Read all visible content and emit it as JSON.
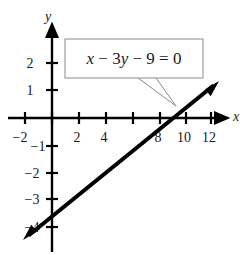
{
  "figure": {
    "background_color": "#ffffff",
    "ink_color": "#000000",
    "callout_border_color": "#888888"
  },
  "callout": {
    "equation": "x − 3y − 9 = 0",
    "parts": {
      "x": "x",
      "minus1": "−",
      "coef3": "3",
      "y": "y",
      "minus2": "−",
      "nine": "9",
      "equals": "=",
      "zero": "0"
    },
    "box": {
      "x": 65,
      "y": 39,
      "width": 138,
      "height": 39
    },
    "pointer_tip": {
      "x": 176,
      "y": 106
    },
    "pointer_base_left": {
      "x": 138,
      "y": 78
    },
    "pointer_base_right": {
      "x": 156,
      "y": 78
    }
  },
  "axes": {
    "x_name": "x",
    "y_name": "y",
    "x_name_pos": {
      "x": 236,
      "y": 118
    },
    "y_name_pos": {
      "x": 48,
      "y": 18
    },
    "origin_px": {
      "x": 52,
      "y": 118
    },
    "px_per_x_unit": 13.4,
    "px_per_y_unit": 27.3,
    "x_axis_start_px": 8,
    "x_axis_end_px": 224,
    "y_axis_top_px": 30,
    "y_axis_bottom_px": 252,
    "x_ticks": [
      {
        "value": -2,
        "label": "−2",
        "px": 25,
        "label_x": 20,
        "label_y": 142
      },
      {
        "value": 0,
        "label": "",
        "px": 52,
        "label_x": 52,
        "label_y": 142
      },
      {
        "value": 2,
        "label": "2",
        "px": 79,
        "label_x": 77,
        "label_y": 142
      },
      {
        "value": 4,
        "label": "4",
        "px": 106,
        "label_x": 104,
        "label_y": 142
      },
      {
        "value": 6,
        "label": "",
        "px": 133,
        "label_x": 131,
        "label_y": 142
      },
      {
        "value": 8,
        "label": "8",
        "px": 160,
        "label_x": 158,
        "label_y": 142
      },
      {
        "value": 10,
        "label": "10",
        "px": 186,
        "label_x": 184,
        "label_y": 142
      },
      {
        "value": 12,
        "label": "12",
        "px": 211,
        "label_x": 209,
        "label_y": 142
      }
    ],
    "y_ticks": [
      {
        "value": 2,
        "label": "2",
        "px": 63,
        "label_x": 30,
        "label_y": 68
      },
      {
        "value": 1,
        "label": "1",
        "px": 90,
        "label_x": 30,
        "label_y": 95
      },
      {
        "value": -1,
        "label": "−1",
        "px": 146,
        "label_x": 38,
        "label_y": 151
      },
      {
        "value": -2,
        "label": "−2",
        "px": 173,
        "label_x": 32,
        "label_y": 178
      },
      {
        "value": -3,
        "label": "−3",
        "px": 199,
        "label_x": 32,
        "label_y": 204
      },
      {
        "value": -4,
        "label": "−4",
        "px": 227,
        "label_x": 32,
        "label_y": 232
      }
    ],
    "tick_half_length": 6
  },
  "chart_data": {
    "type": "line",
    "title": "x − 3y − 9 = 0",
    "subtitle": "",
    "xlabel": "x",
    "ylabel": "y",
    "xlim": [
      -3.3,
      12.8
    ],
    "ylim": [
      -4.3,
      3.2
    ],
    "grid": false,
    "legend": null,
    "annotations": [
      {
        "text": "x − 3y − 9 = 0",
        "type": "callout-box",
        "points_to_data": [
          9.2,
          0.1
        ]
      }
    ],
    "xticks": [
      -2,
      0,
      2,
      4,
      6,
      8,
      10,
      12
    ],
    "xticklabels": [
      "−2",
      "",
      "2",
      "4",
      "",
      "8",
      "10",
      "12"
    ],
    "yticks": [
      2,
      1,
      0,
      -1,
      -2,
      -3,
      -4
    ],
    "yticklabels": [
      "2",
      "1",
      "",
      "−1",
      "−2",
      "−3",
      "−4"
    ],
    "series": [
      {
        "name": "x − 3y − 9 = 0",
        "equation_slope": 0.3333,
        "equation_intercept": -3,
        "style": "solid-double-arrow",
        "color": "#000000",
        "line_width_px": 4,
        "x": [
          -2.2,
          12.4
        ],
        "y": [
          -3.73,
          1.13
        ],
        "key_points": [
          {
            "x": 0,
            "y": -3,
            "label": "y-intercept"
          },
          {
            "x": 9,
            "y": 0,
            "label": "x-intercept"
          }
        ],
        "endpoints_px": {
          "start": {
            "x": 23,
            "y": 240
          },
          "end": {
            "x": 219,
            "y": 81
          }
        }
      }
    ]
  }
}
